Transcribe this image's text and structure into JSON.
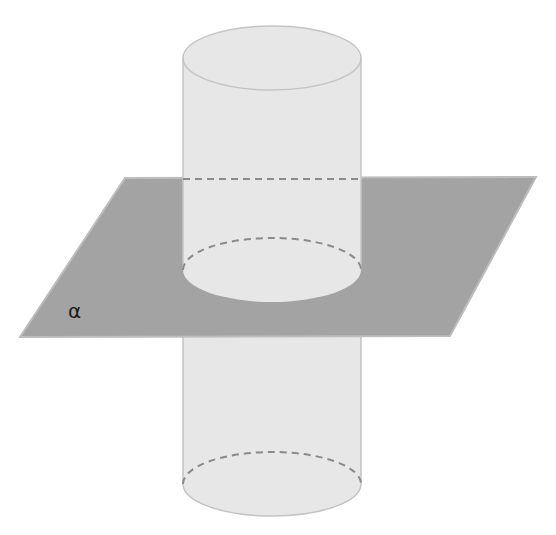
{
  "figure": {
    "plane": {
      "label": "α",
      "fill": "#a3a3a3",
      "edge": "#bdbdbd",
      "corners": [
        [
          125,
          178
        ],
        [
          536,
          177
        ],
        [
          450,
          336
        ],
        [
          20,
          337
        ]
      ]
    },
    "cylinder": {
      "fill": "#e7e7e7",
      "edge": "#c4c4c4",
      "dash_color": "#8a8a8a",
      "center_x": 272,
      "radius_x": 89,
      "radius_y": 32,
      "top_y": 58,
      "middle_y": 270,
      "bottom_y": 484
    }
  }
}
